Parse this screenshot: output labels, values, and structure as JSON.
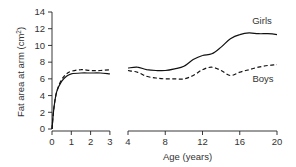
{
  "chart_data": {
    "type": "line",
    "title": "",
    "xlabel": "Age (years)",
    "ylabel": "Fat area at arm (cm²)",
    "ylim": [
      0,
      14
    ],
    "yticks": [
      0,
      2,
      4,
      6,
      8,
      10,
      12,
      14
    ],
    "x_segments": [
      {
        "range": [
          0,
          3
        ],
        "ticks": [
          0,
          1,
          2,
          3
        ],
        "unit": "years"
      },
      {
        "range": [
          4,
          20
        ],
        "ticks": [
          4,
          8,
          12,
          16,
          20
        ],
        "unit": "years"
      }
    ],
    "grid": false,
    "legend": "inline labels at right",
    "series": [
      {
        "name": "Girls",
        "style": "solid",
        "segment1": {
          "x": [
            0,
            0.1,
            0.25,
            0.5,
            0.75,
            1,
            1.5,
            2,
            2.5,
            3
          ],
          "y": [
            0,
            2.5,
            4.5,
            5.7,
            6.3,
            6.6,
            6.7,
            6.7,
            6.7,
            6.6
          ]
        },
        "segment2": {
          "x": [
            4,
            5,
            6,
            7,
            8,
            9,
            10,
            11,
            12,
            13,
            14,
            15,
            16,
            17,
            18,
            19,
            20
          ],
          "y": [
            7.3,
            7.4,
            7.1,
            7.0,
            7.0,
            7.2,
            7.5,
            8.3,
            8.8,
            9.0,
            9.8,
            10.8,
            11.3,
            11.5,
            11.4,
            11.4,
            11.3
          ]
        }
      },
      {
        "name": "Boys",
        "style": "dashed",
        "segment1": {
          "x": [
            0,
            0.1,
            0.25,
            0.5,
            0.75,
            1,
            1.5,
            2,
            2.5,
            3
          ],
          "y": [
            0,
            2.5,
            4.5,
            5.9,
            6.6,
            6.9,
            7.1,
            7.0,
            7.0,
            7.1
          ]
        },
        "segment2": {
          "x": [
            4,
            5,
            6,
            7,
            8,
            9,
            10,
            11,
            12,
            13,
            14,
            15,
            16,
            17,
            18,
            19,
            20
          ],
          "y": [
            7.0,
            6.8,
            6.3,
            6.1,
            6.0,
            6.0,
            6.0,
            6.4,
            7.1,
            7.4,
            7.0,
            6.4,
            6.8,
            7.1,
            7.4,
            7.6,
            7.7
          ]
        }
      }
    ],
    "annotations": [
      "Girls",
      "Boys"
    ]
  },
  "labels": {
    "ylabel": "Fat area at arm (cm",
    "ylabel_sup": "2",
    "ylabel_end": ")",
    "xlabel": "Age (years)",
    "girls": "Girls",
    "boys": "Boys"
  }
}
